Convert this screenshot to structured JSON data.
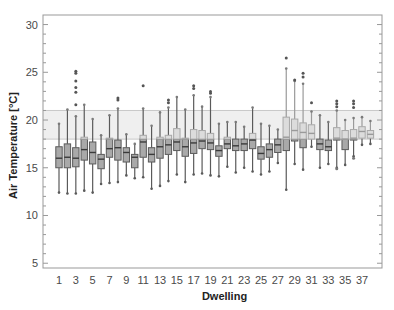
{
  "chart_data": {
    "type": "box",
    "title": "",
    "xlabel": "Dwelling",
    "ylabel": "Air Temperature [°C]",
    "ylim": [
      4.5,
      31
    ],
    "yticks": [
      5,
      10,
      15,
      20,
      25,
      30
    ],
    "xtick_labels": [
      "1",
      "3",
      "5",
      "7",
      "9",
      "11",
      "13",
      "15",
      "17",
      "19",
      "21",
      "23",
      "25",
      "27",
      "29",
      "31",
      "33",
      "35",
      "37"
    ],
    "grid": false,
    "comfort_band": {
      "low": 18,
      "high": 21
    },
    "colors": {
      "box_below_band": "#a9a9a9",
      "box_in_band": "#dcdcdc",
      "edge": "#5a5a5a",
      "band": "#efefef",
      "band_edge": "#c8c8c8",
      "frame": "#999999"
    },
    "dwellings": [
      {
        "id": 1,
        "min": 12.4,
        "q1": 15.0,
        "median": 16.0,
        "q3": 17.2,
        "max": 19.6,
        "outliers": []
      },
      {
        "id": 2,
        "min": 12.3,
        "q1": 15.0,
        "median": 16.1,
        "q3": 17.5,
        "max": 21.1,
        "outliers": []
      },
      {
        "id": 3,
        "min": 12.3,
        "q1": 15.1,
        "median": 16.0,
        "q3": 17.1,
        "max": 20.4,
        "outliers": [
          21.6,
          22.9,
          23.4,
          24.1,
          24.9,
          25.1
        ]
      },
      {
        "id": 4,
        "min": 12.6,
        "q1": 15.8,
        "median": 16.9,
        "q3": 18.2,
        "max": 21.6,
        "outliers": []
      },
      {
        "id": 5,
        "min": 12.4,
        "q1": 15.4,
        "median": 16.6,
        "q3": 17.7,
        "max": 20.1,
        "outliers": []
      },
      {
        "id": 6,
        "min": 13.3,
        "q1": 14.9,
        "median": 15.9,
        "q3": 16.4,
        "max": 18.4,
        "outliers": []
      },
      {
        "id": 7,
        "min": 13.4,
        "q1": 16.1,
        "median": 17.0,
        "q3": 18.1,
        "max": 20.5,
        "outliers": []
      },
      {
        "id": 8,
        "min": 13.5,
        "q1": 15.8,
        "median": 17.1,
        "q3": 17.9,
        "max": 21.2,
        "outliers": [
          22.1,
          22.3
        ]
      },
      {
        "id": 9,
        "min": 14.2,
        "q1": 15.6,
        "median": 16.6,
        "q3": 17.1,
        "max": 18.5,
        "outliers": []
      },
      {
        "id": 10,
        "min": 13.9,
        "q1": 15.0,
        "median": 16.1,
        "q3": 16.4,
        "max": 17.5,
        "outliers": []
      },
      {
        "id": 11,
        "min": 14.0,
        "q1": 16.1,
        "median": 17.7,
        "q3": 18.4,
        "max": 21.2,
        "outliers": [
          23.6
        ]
      },
      {
        "id": 12,
        "min": 12.8,
        "q1": 15.6,
        "median": 16.4,
        "q3": 17.1,
        "max": 19.4,
        "outliers": []
      },
      {
        "id": 13,
        "min": 13.1,
        "q1": 16.0,
        "median": 17.2,
        "q3": 18.2,
        "max": 20.8,
        "outliers": []
      },
      {
        "id": 14,
        "min": 13.6,
        "q1": 16.4,
        "median": 17.4,
        "q3": 18.4,
        "max": 21.3,
        "outliers": [
          21.8,
          22.1
        ]
      },
      {
        "id": 15,
        "min": 14.3,
        "q1": 16.8,
        "median": 17.7,
        "q3": 19.1,
        "max": 22.4,
        "outliers": []
      },
      {
        "id": 16,
        "min": 13.5,
        "q1": 16.2,
        "median": 17.2,
        "q3": 18.1,
        "max": 21.1,
        "outliers": []
      },
      {
        "id": 17,
        "min": 14.3,
        "q1": 16.5,
        "median": 17.6,
        "q3": 19.0,
        "max": 22.6,
        "outliers": [
          23.3,
          23.6
        ]
      },
      {
        "id": 18,
        "min": 14.4,
        "q1": 17.0,
        "median": 17.8,
        "q3": 18.9,
        "max": 21.4,
        "outliers": []
      },
      {
        "id": 19,
        "min": 14.2,
        "q1": 16.9,
        "median": 17.6,
        "q3": 18.6,
        "max": 22.4,
        "outliers": [
          22.8,
          23.0
        ]
      },
      {
        "id": 20,
        "min": 14.1,
        "q1": 16.2,
        "median": 16.8,
        "q3": 17.3,
        "max": 19.6,
        "outliers": []
      },
      {
        "id": 21,
        "min": 15.1,
        "q1": 17.0,
        "median": 17.5,
        "q3": 18.2,
        "max": 19.8,
        "outliers": []
      },
      {
        "id": 22,
        "min": 14.5,
        "q1": 16.8,
        "median": 17.3,
        "q3": 18.0,
        "max": 19.8,
        "outliers": []
      },
      {
        "id": 23,
        "min": 15.0,
        "q1": 16.8,
        "median": 17.5,
        "q3": 18.0,
        "max": 19.3,
        "outliers": []
      },
      {
        "id": 24,
        "min": 14.6,
        "q1": 17.0,
        "median": 17.9,
        "q3": 18.6,
        "max": 21.3,
        "outliers": []
      },
      {
        "id": 25,
        "min": 14.3,
        "q1": 15.9,
        "median": 16.5,
        "q3": 17.2,
        "max": 19.6,
        "outliers": []
      },
      {
        "id": 26,
        "min": 14.6,
        "q1": 16.1,
        "median": 16.9,
        "q3": 17.5,
        "max": 19.4,
        "outliers": []
      },
      {
        "id": 27,
        "min": 15.5,
        "q1": 16.6,
        "median": 17.4,
        "q3": 18.0,
        "max": 19.0,
        "outliers": []
      },
      {
        "id": 28,
        "min": 12.7,
        "q1": 16.8,
        "median": 18.2,
        "q3": 20.3,
        "max": 25.4,
        "outliers": [
          26.5
        ]
      },
      {
        "id": 29,
        "min": 15.4,
        "q1": 17.8,
        "median": 18.9,
        "q3": 20.1,
        "max": 24.1,
        "outliers": [
          24.2
        ]
      },
      {
        "id": 30,
        "min": 14.8,
        "q1": 17.1,
        "median": 18.7,
        "q3": 19.7,
        "max": 23.8,
        "outliers": [
          24.5,
          24.9
        ]
      },
      {
        "id": 31,
        "min": 17.2,
        "q1": 18.0,
        "median": 18.6,
        "q3": 19.5,
        "max": 20.9,
        "outliers": [
          21.8
        ]
      },
      {
        "id": 32,
        "min": 15.0,
        "q1": 16.9,
        "median": 17.5,
        "q3": 18.0,
        "max": 20.5,
        "outliers": []
      },
      {
        "id": 33,
        "min": 15.4,
        "q1": 16.8,
        "median": 17.2,
        "q3": 17.9,
        "max": 19.8,
        "outliers": []
      },
      {
        "id": 34,
        "min": 15.0,
        "q1": 17.9,
        "median": 18.1,
        "q3": 19.2,
        "max": 21.0,
        "outliers": [
          21.4,
          21.7,
          22.0,
          14.9
        ]
      },
      {
        "id": 35,
        "min": 15.3,
        "q1": 16.9,
        "median": 18.0,
        "q3": 18.9,
        "max": 20.0,
        "outliers": []
      },
      {
        "id": 36,
        "min": 16.2,
        "q1": 17.9,
        "median": 18.1,
        "q3": 19.0,
        "max": 20.2,
        "outliers": [
          21.3,
          21.7,
          22.0,
          16.0
        ]
      },
      {
        "id": 37,
        "min": 17.4,
        "q1": 18.1,
        "median": 18.8,
        "q3": 19.3,
        "max": 20.3,
        "outliers": []
      },
      {
        "id": 38,
        "min": 17.5,
        "q1": 18.1,
        "median": 18.5,
        "q3": 18.9,
        "max": 19.9,
        "outliers": []
      }
    ]
  }
}
